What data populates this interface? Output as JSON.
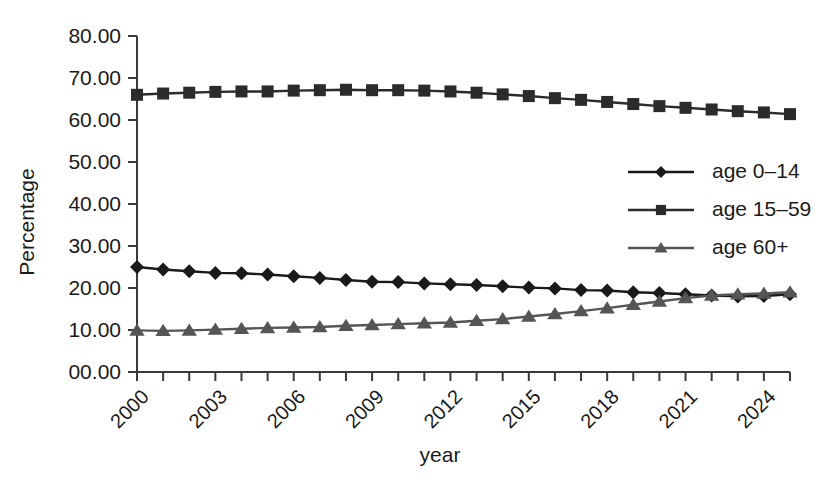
{
  "chart_data": {
    "type": "line",
    "title": "",
    "xlabel": "year",
    "ylabel": "Percentage",
    "grid": false,
    "legend_position": "center-right",
    "xlim": [
      2000,
      2025
    ],
    "ylim": [
      0,
      80
    ],
    "y_ticks": [
      0,
      10,
      20,
      30,
      40,
      50,
      60,
      70,
      80
    ],
    "y_tick_labels": [
      "00.00",
      "10.00",
      "20.00",
      "30.00",
      "40.00",
      "50.00",
      "60.00",
      "70.00",
      "80.00"
    ],
    "x": [
      2000,
      2001,
      2002,
      2003,
      2004,
      2005,
      2006,
      2007,
      2008,
      2009,
      2010,
      2011,
      2012,
      2013,
      2014,
      2015,
      2016,
      2017,
      2018,
      2019,
      2020,
      2021,
      2022,
      2023,
      2024,
      2025
    ],
    "x_tick_labels": [
      "2000",
      "",
      "",
      "2003",
      "",
      "",
      "2006",
      "",
      "",
      "2009",
      "",
      "",
      "2012",
      "",
      "",
      "2015",
      "",
      "",
      "2018",
      "",
      "",
      "2021",
      "",
      "",
      "2024",
      ""
    ],
    "series": [
      {
        "name": "age 0–14",
        "marker": "diamond",
        "color": "#1a1a1a",
        "values": [
          25.0,
          24.4,
          24.0,
          23.6,
          23.5,
          23.2,
          22.8,
          22.4,
          21.9,
          21.5,
          21.4,
          21.1,
          20.9,
          20.7,
          20.4,
          20.1,
          19.9,
          19.5,
          19.4,
          19.0,
          18.8,
          18.5,
          18.2,
          18.0,
          18.1,
          18.5
        ]
      },
      {
        "name": "age 15–59",
        "marker": "square",
        "color": "#2b2b2b",
        "values": [
          66.0,
          66.3,
          66.5,
          66.7,
          66.8,
          66.8,
          67.0,
          67.1,
          67.2,
          67.1,
          67.1,
          67.0,
          66.8,
          66.5,
          66.1,
          65.7,
          65.2,
          64.8,
          64.3,
          63.8,
          63.3,
          62.9,
          62.5,
          62.1,
          61.8,
          61.4
        ]
      },
      {
        "name": "age  60+",
        "marker": "triangle",
        "color": "#555555",
        "values": [
          9.9,
          9.8,
          9.9,
          10.1,
          10.3,
          10.5,
          10.6,
          10.7,
          11.0,
          11.2,
          11.4,
          11.6,
          11.8,
          12.2,
          12.6,
          13.2,
          13.8,
          14.5,
          15.2,
          16.0,
          16.8,
          17.6,
          18.2,
          18.5,
          18.7,
          19.0
        ]
      }
    ]
  },
  "labels": {
    "y_axis_title": "Percentage",
    "x_axis_title": "year",
    "legend": [
      "age 0–14",
      "age 15–59",
      "age  60+"
    ]
  },
  "colors": {
    "background": "#ffffff",
    "axis": "#3a3a3a",
    "text": "#1a1a1a",
    "series_0_14": "#1a1a1a",
    "series_15_59": "#2b2b2b",
    "series_60_plus": "#555555"
  }
}
